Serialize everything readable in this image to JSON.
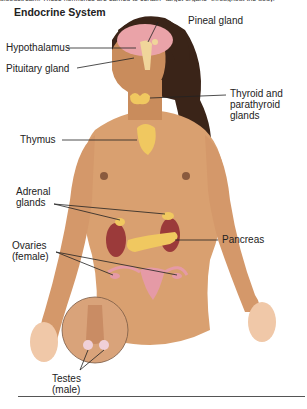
{
  "header": {
    "intro_text_cut": "bloodstream. These hormones are carried to certain \"target organs\" throughout the body.",
    "title": "Endocrine System"
  },
  "labels": {
    "pineal": "Pineal gland",
    "hypothalamus": "Hypothalamus",
    "pituitary": "Pituitary gland",
    "thyroid_line1": "Thyroid and",
    "thyroid_line2": "parathyroid",
    "thyroid_line3": "glands",
    "thymus": "Thymus",
    "adrenal_line1": "Adrenal",
    "adrenal_line2": "glands",
    "pancreas": "Pancreas",
    "ovaries_line1": "Ovaries",
    "ovaries_line2": "(female)",
    "testes_line1": "Testes",
    "testes_line2": "(male)"
  },
  "colors": {
    "skin": "#d9a070",
    "hair": "#3a2418",
    "brain": "#eaa3a8",
    "gland": "#f0c860",
    "kidney": "#9b3a3a",
    "reproductive": "#e59aa6",
    "leader_line": "#222222"
  }
}
